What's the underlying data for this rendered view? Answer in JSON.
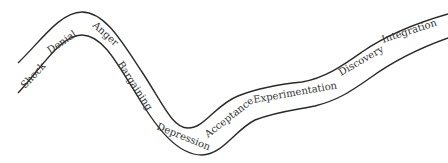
{
  "diagram": {
    "type": "curved-road-process",
    "stages": [
      {
        "label": "Shock"
      },
      {
        "label": "Denial"
      },
      {
        "label": "Anger"
      },
      {
        "label": "Bargaining"
      },
      {
        "label": "Depression"
      },
      {
        "label": "Acceptance"
      },
      {
        "label": "Experimentation"
      },
      {
        "label": "Discovery"
      },
      {
        "label": "Integration"
      }
    ],
    "colors": {
      "stroke": "#2a2a2a",
      "text": "#333333",
      "background": "#ffffff"
    }
  }
}
